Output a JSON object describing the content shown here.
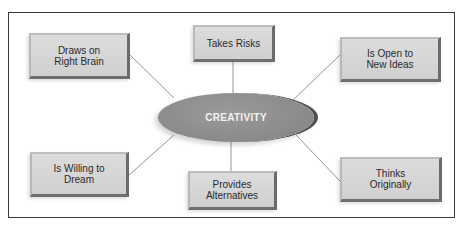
{
  "diagram": {
    "center": {
      "label": "CREATIVITY"
    },
    "nodes": [
      {
        "id": "top-left",
        "label": "Draws on\nRight Brain"
      },
      {
        "id": "top-center",
        "label": "Takes Risks"
      },
      {
        "id": "top-right",
        "label": "Is Open to\nNew Ideas"
      },
      {
        "id": "bottom-left",
        "label": "Is Willing to\nDream"
      },
      {
        "id": "bottom-center",
        "label": "Provides\nAlternatives"
      },
      {
        "id": "bottom-right",
        "label": "Thinks\nOriginally"
      }
    ],
    "colors": {
      "node_face": "#d4d4d4",
      "node_bevel": "#6b6b6b",
      "hub_fill": "#8e8e8e",
      "hub_rim": "#505050",
      "connector": "#7a7a7a",
      "frame": "#3a3a3a"
    }
  }
}
